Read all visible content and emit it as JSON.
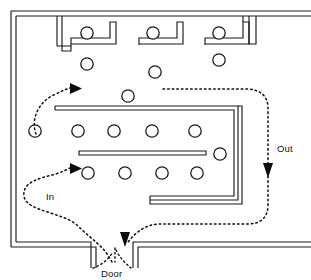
{
  "diagram": {
    "type": "floor-plan",
    "width": 311,
    "height": 280,
    "background_color": "#ffffff",
    "line_color": "#1a1a1a",
    "flow_color": "#111111"
  },
  "labels": {
    "in": "In",
    "out": "Out",
    "door": "Door"
  },
  "icons": {
    "in_arrow": "arrow-right-icon",
    "out_arrow": "arrow-down-icon",
    "door_arrow": "arrow-down-icon"
  },
  "counts": {
    "round_tables": 22,
    "booth_alcoves": 3,
    "doors": 1,
    "flow_paths": 2
  },
  "tables": [
    {
      "id": "t-alcove-1",
      "cx": 87,
      "cy": 33,
      "r": 6.2,
      "zone": "top-alcove"
    },
    {
      "id": "t-alcove-2",
      "cx": 153,
      "cy": 33,
      "r": 6.2,
      "zone": "top-alcove"
    },
    {
      "id": "t-alcove-3",
      "cx": 219,
      "cy": 33,
      "r": 6.2,
      "zone": "top-alcove"
    },
    {
      "id": "t-upper-1",
      "cx": 87,
      "cy": 64,
      "r": 6.2,
      "zone": "upper-floor"
    },
    {
      "id": "t-upper-2",
      "cx": 155,
      "cy": 72,
      "r": 6.2,
      "zone": "upper-floor"
    },
    {
      "id": "t-upper-3",
      "cx": 219,
      "cy": 60,
      "r": 6.2,
      "zone": "upper-floor"
    },
    {
      "id": "t-upper-4",
      "cx": 128,
      "cy": 96,
      "r": 6.2,
      "zone": "upper-floor"
    },
    {
      "id": "t-left-1",
      "cx": 35,
      "cy": 131,
      "r": 6.2,
      "zone": "left-aisle"
    },
    {
      "id": "t-row1-1",
      "cx": 78,
      "cy": 131,
      "r": 6.2,
      "zone": "main-row-1"
    },
    {
      "id": "t-row1-2",
      "cx": 114,
      "cy": 131,
      "r": 6.2,
      "zone": "main-row-1"
    },
    {
      "id": "t-row1-3",
      "cx": 152,
      "cy": 131,
      "r": 6.2,
      "zone": "main-row-1"
    },
    {
      "id": "t-row1-4",
      "cx": 195,
      "cy": 131,
      "r": 6.2,
      "zone": "main-row-1"
    },
    {
      "id": "t-right-1",
      "cx": 220,
      "cy": 154,
      "r": 6.2,
      "zone": "right-aisle"
    },
    {
      "id": "t-row2-1",
      "cx": 88,
      "cy": 173,
      "r": 6.2,
      "zone": "main-row-2"
    },
    {
      "id": "t-row2-2",
      "cx": 125,
      "cy": 173,
      "r": 6.2,
      "zone": "main-row-2"
    },
    {
      "id": "t-row2-3",
      "cx": 162,
      "cy": 173,
      "r": 6.2,
      "zone": "main-row-2"
    },
    {
      "id": "t-row2-4",
      "cx": 197,
      "cy": 173,
      "r": 6.2,
      "zone": "main-row-2"
    }
  ]
}
